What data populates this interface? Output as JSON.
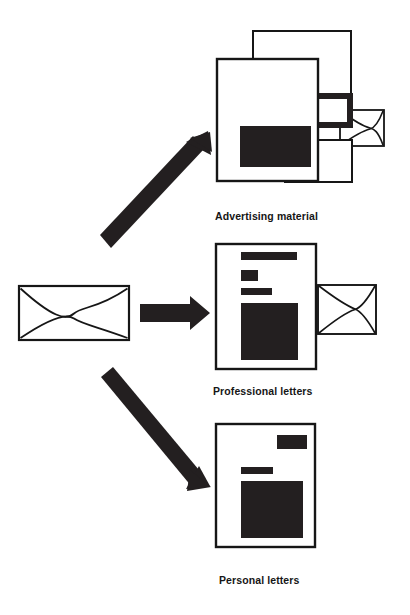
{
  "diagram": {
    "type": "flow-diagram",
    "source_node": {
      "name": "envelope",
      "icon": "envelope-icon",
      "label": ""
    },
    "branches": [
      {
        "id": "advertising",
        "label": "Advertising material",
        "arrow": "diagonal-up-right",
        "icon": "document-stack-icon",
        "sheets": 3,
        "has_envelope": true
      },
      {
        "id": "professional",
        "label": "Professional letters",
        "arrow": "horizontal-right",
        "icon": "document-icon",
        "sheets": 1,
        "has_envelope": true
      },
      {
        "id": "personal",
        "label": "Personal letters",
        "arrow": "diagonal-down-right",
        "icon": "document-icon",
        "sheets": 1,
        "has_envelope": false
      }
    ],
    "colors": {
      "ink": "#161616",
      "fill": "#231f20",
      "paper": "#ffffff",
      "background": "#ffffff"
    }
  }
}
